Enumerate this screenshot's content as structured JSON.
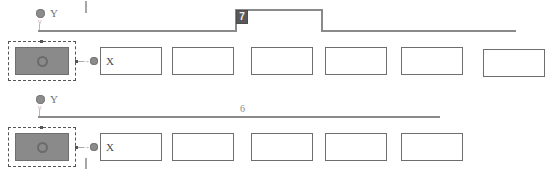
{
  "diagram": {
    "colors": {
      "track_line": "#8a8a8a",
      "node_fill": "#8a8a8a",
      "node_stroke": "#6e6e6e",
      "selection_stroke": "#555555",
      "badge_background": "#595959",
      "badge_text": "#f2f2f2",
      "box_stroke": "#6f6f6f",
      "box_fill": "#ffffff",
      "label_text": "#707070",
      "canvas_background": "#ffffff"
    },
    "rows": [
      {
        "id": "row-1",
        "node_label": "Y",
        "step_label": "7",
        "step_label_style": "badge",
        "selected_node_label": "",
        "boxes": [
          {
            "label": "X"
          },
          {
            "label": ""
          },
          {
            "label": ""
          },
          {
            "label": ""
          },
          {
            "label": ""
          },
          {
            "label": ""
          },
          {
            "label": ""
          }
        ]
      },
      {
        "id": "row-2",
        "node_label": "Y",
        "step_label": "6",
        "step_label_style": "plain",
        "selected_node_label": "",
        "boxes": [
          {
            "label": "X"
          },
          {
            "label": ""
          },
          {
            "label": ""
          },
          {
            "label": ""
          },
          {
            "label": ""
          }
        ]
      }
    ],
    "marks": {
      "top_tick": "|",
      "bottom_tick": "|",
      "y_tick_glyph": "v",
      "connector_glyph": "←"
    }
  }
}
